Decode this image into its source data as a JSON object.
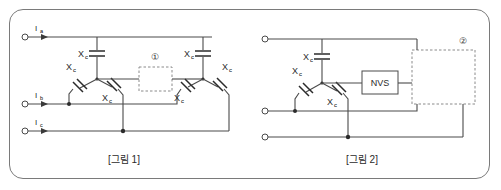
{
  "figure_panel": {
    "background_color": "#ffffff",
    "border_color": "#7a7a7a",
    "wire_color": "#4a4a4a",
    "dashed_color": "#8a8a8a"
  },
  "figure1": {
    "caption": "[그림 1]",
    "callout": "①",
    "terminals": [
      {
        "label_main": "I",
        "label_sub": "a"
      },
      {
        "label_main": "I",
        "label_sub": "b"
      },
      {
        "label_main": "I",
        "label_sub": "c"
      }
    ],
    "capacitors": [
      {
        "label_main": "X",
        "label_sub": "c"
      },
      {
        "label_main": "X",
        "label_sub": "c"
      },
      {
        "label_main": "X",
        "label_sub": "c"
      },
      {
        "label_main": "X",
        "label_sub": "c"
      },
      {
        "label_main": "X",
        "label_sub": "c"
      },
      {
        "label_main": "X",
        "label_sub": "c"
      }
    ]
  },
  "figure2": {
    "caption": "[그림 2]",
    "callout": "②",
    "block_label": "NVS",
    "terminals": [
      {
        "label_main": "",
        "label_sub": ""
      },
      {
        "label_main": "",
        "label_sub": ""
      },
      {
        "label_main": "",
        "label_sub": ""
      }
    ],
    "capacitors": [
      {
        "label_main": "X",
        "label_sub": "c"
      },
      {
        "label_main": "X",
        "label_sub": "c"
      },
      {
        "label_main": "X",
        "label_sub": "c"
      }
    ]
  }
}
